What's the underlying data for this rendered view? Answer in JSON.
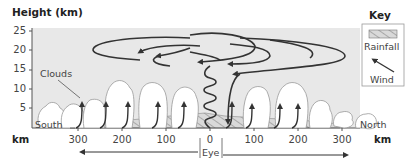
{
  "diagram": {
    "y_axis_title": "Height (km)",
    "y_ticks": [
      "25",
      "20",
      "15",
      "10",
      "5"
    ],
    "x_axis_unit_left": "km",
    "x_axis_unit_right": "km",
    "x_ticks_left": [
      "300",
      "200",
      "100"
    ],
    "x_tick_center": "0",
    "x_ticks_right": [
      "100",
      "200",
      "300"
    ],
    "eye_label": "Eye",
    "clouds_label": "Clouds",
    "south_label": "South",
    "north_label": "North"
  },
  "key": {
    "title": "Key",
    "rainfall_label": "Rainfall",
    "wind_label": "Wind"
  },
  "colors": {
    "panel_bg": "#e8e8e8",
    "line": "#333333",
    "cloud_fill": "#ffffff",
    "cloud_stroke": "#999999"
  }
}
